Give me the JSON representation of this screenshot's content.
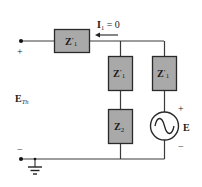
{
  "diagram": {
    "type": "circuit-schematic",
    "colors": {
      "wire": "#3a3a3a",
      "component_fill": "#a9a9a9",
      "component_stroke": "#2a2a2a",
      "text": "#1a1a1a",
      "source_fill": "#ffffff"
    },
    "terminals": {
      "top": {
        "polarity": "+"
      },
      "bottom": {
        "polarity": "−"
      },
      "voltage_label": {
        "main": "E",
        "sub": "Th"
      }
    },
    "current": {
      "symbol": "I",
      "sub": "1",
      "rest": " = 0"
    },
    "components": [
      {
        "id": "z1-series",
        "main": "Z",
        "prime": "'",
        "sub": "1"
      },
      {
        "id": "z1-middle",
        "main": "Z",
        "prime": "'",
        "sub": "1"
      },
      {
        "id": "z1-right",
        "main": "Z",
        "prime": "'",
        "sub": "1"
      },
      {
        "id": "z2",
        "main": "Z",
        "prime": "",
        "sub": "2"
      }
    ],
    "source": {
      "label": "E",
      "plus": "+",
      "minus": "−",
      "symbol": "ac-sine"
    },
    "ground": {
      "symbol": "ground"
    }
  }
}
